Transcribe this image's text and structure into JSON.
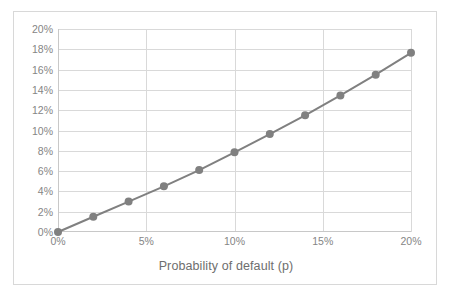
{
  "chart_data": {
    "type": "line",
    "title": "",
    "xlabel": "Probability of default (p)",
    "ylabel": "",
    "x": [
      0,
      2,
      4,
      6,
      8,
      10,
      12,
      14,
      16,
      18,
      20
    ],
    "values": [
      0,
      1.5,
      3.0,
      4.5,
      6.1,
      7.85,
      9.65,
      11.5,
      13.45,
      15.5,
      17.65
    ],
    "series": [
      {
        "name": "",
        "values": [
          0,
          1.5,
          3.0,
          4.5,
          6.1,
          7.85,
          9.65,
          11.5,
          13.45,
          15.5,
          17.65
        ]
      }
    ],
    "xlim": [
      0,
      20
    ],
    "ylim": [
      0,
      20
    ],
    "x_tick_values": [
      0,
      5,
      10,
      15,
      20
    ],
    "x_tick_labels": [
      "0%",
      "5%",
      "10%",
      "15%",
      "20%"
    ],
    "y_tick_values": [
      0,
      2,
      4,
      6,
      8,
      10,
      12,
      14,
      16,
      18,
      20
    ],
    "y_tick_labels": [
      "0%",
      "2%",
      "4%",
      "6%",
      "8%",
      "10%",
      "12%",
      "14%",
      "16%",
      "18%",
      "20%"
    ],
    "grid": "horizontal-and-vertical",
    "legend": "none",
    "marker": "circle",
    "series_color": "#808080",
    "gridline_color": "#d9d9d9",
    "text_color": "#858585",
    "border_color": "#d8d8d8",
    "background_color": "#ffffff"
  }
}
